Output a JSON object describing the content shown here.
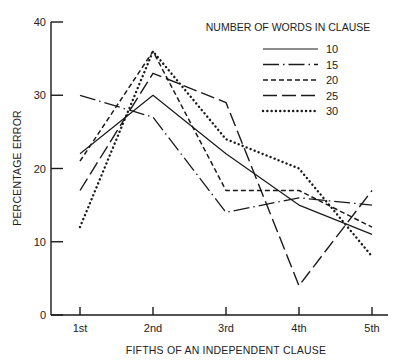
{
  "chart_data": {
    "type": "line",
    "title": "",
    "xlabel": "FIFTHS OF AN INDEPENDENT CLAUSE",
    "ylabel": "PERCENTAGE ERROR",
    "categories": [
      "1st",
      "2nd",
      "3rd",
      "4th",
      "5th"
    ],
    "ylim": [
      0,
      40
    ],
    "yticks": [
      0,
      10,
      20,
      30,
      40
    ],
    "grid": false,
    "legend": {
      "title": "NUMBER OF WORDS IN CLAUSE",
      "position": "upper right"
    },
    "series": [
      {
        "name": "10",
        "style": "solid",
        "values": [
          22,
          30,
          22,
          15,
          11
        ]
      },
      {
        "name": "15",
        "style": "dash-dot",
        "values": [
          30,
          27,
          14,
          16,
          15
        ]
      },
      {
        "name": "20",
        "style": "short-dash",
        "values": [
          21,
          36,
          17,
          17,
          12
        ]
      },
      {
        "name": "25",
        "style": "long-dash",
        "values": [
          17,
          33,
          29,
          4,
          17
        ]
      },
      {
        "name": "30",
        "style": "dotted",
        "values": [
          12,
          36,
          24,
          20,
          8
        ]
      }
    ]
  },
  "colors": {
    "line": "#1a1a1a",
    "background": "#ffffff"
  }
}
